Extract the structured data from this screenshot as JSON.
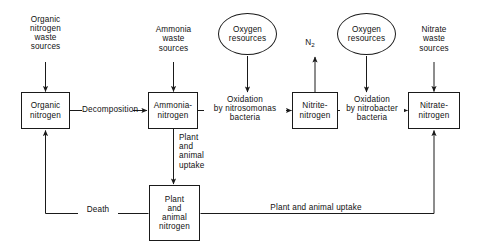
{
  "diagram": {
    "stroke_color": "#1a1a1a",
    "background": "#ffffff",
    "boxes": [
      {
        "id": "organic-nitrogen",
        "lines": [
          "Organic",
          "nitrogen"
        ]
      },
      {
        "id": "ammonia-nitrogen",
        "lines": [
          "Ammonia-",
          "nitrogen"
        ]
      },
      {
        "id": "nitrite-nitrogen",
        "lines": [
          "Nitrite-",
          "nitrogen"
        ]
      },
      {
        "id": "nitrate-nitrogen",
        "lines": [
          "Nitrate-",
          "nitrogen"
        ]
      },
      {
        "id": "plant-animal-nitrogen",
        "lines": [
          "Plant",
          "and",
          "animal",
          "nitrogen"
        ]
      }
    ],
    "ellipses": [
      {
        "id": "oxygen-resources-left",
        "lines": [
          "Oxygen",
          "resources"
        ]
      },
      {
        "id": "oxygen-resources-right",
        "lines": [
          "Oxygen",
          "resources"
        ]
      }
    ],
    "sources": [
      {
        "id": "organic-nitrogen-waste-sources",
        "lines": [
          "Organic",
          "nitrogen",
          "waste",
          "sources"
        ]
      },
      {
        "id": "ammonia-waste-sources",
        "lines": [
          "Ammonia",
          "waste",
          "sources"
        ]
      },
      {
        "id": "nitrate-waste-sources",
        "lines": [
          "Nitrate",
          "waste",
          "sources"
        ]
      }
    ],
    "edge_labels": [
      {
        "id": "decomposition",
        "lines": [
          "Decomposition"
        ]
      },
      {
        "id": "oxidation-nitrosomonas",
        "lines": [
          "Oxidation",
          "by nitrosomonas",
          "bacteria"
        ]
      },
      {
        "id": "oxidation-nitrobacter",
        "lines": [
          "Oxidation",
          "by nitrobacter",
          "bacteria"
        ]
      },
      {
        "id": "plant-animal-uptake-vertical",
        "lines": [
          "Plant",
          "and",
          "animal",
          "uptake"
        ]
      },
      {
        "id": "death",
        "lines": [
          "Death"
        ]
      },
      {
        "id": "plant-animal-uptake-horizontal",
        "lines": [
          "Plant and animal uptake"
        ]
      }
    ],
    "outputs": [
      {
        "id": "nitrogen-gas",
        "text": "N",
        "subscript": "2"
      }
    ]
  }
}
